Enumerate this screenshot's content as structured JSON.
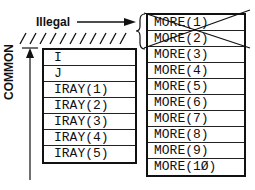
{
  "labels": {
    "illegal": "Illegal",
    "common": "COMMON"
  },
  "common_block": {
    "rows": [
      "I",
      "J",
      "IRAY(1)",
      "IRAY(2)",
      "IRAY(3)",
      "IRAY(4)",
      "IRAY(5)"
    ]
  },
  "more_array": {
    "rows": [
      "MORE(1)",
      "MORE(2)",
      "MORE(3)",
      "MORE(4)",
      "MORE(5)",
      "MORE(6)",
      "MORE(7)",
      "MORE(8)",
      "MORE(9)",
      "MORE(1Ø)"
    ],
    "crossed_out": [
      "MORE(1)",
      "MORE(2)"
    ]
  }
}
